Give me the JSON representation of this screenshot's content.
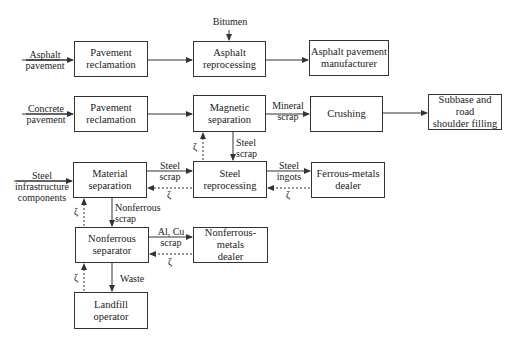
{
  "diagram": {
    "boxes": {
      "pav_rec_1": "Pavement\nreclamation",
      "asphalt_repro": "Asphalt\nreprocessing",
      "asphalt_mfr": "Asphalt pavement\nmanufacturer",
      "pav_rec_2": "Pavement\nreclamation",
      "magnetic_sep": "Magnetic\nseparation",
      "crushing": "Crushing",
      "subbase": "Subbase and road\nshoulder filling",
      "material_sep": "Material\nseparation",
      "steel_repro": "Steel\nreprocessing",
      "ferrous_dealer": "Ferrous-metals\ndealer",
      "nonferrous_sep": "Nonferrous\nseparator",
      "nonferrous_dealer": "Nonferrous-metals\ndealer",
      "landfill": "Landfill\noperator"
    },
    "inputs": {
      "asphalt_pavement": "Asphalt\npavement",
      "bitumen": "Bitumen",
      "concrete_pavement": "Concrete\npavement",
      "steel_infrastructure": "Steel\ninfrastructure\ncomponents"
    },
    "flow_labels": {
      "mineral_scrap": "Mineral\nscrap",
      "steel_scrap_down": "Steel\nscrap",
      "steel_scrap_right": "Steel\nscrap",
      "steel_ingots": "Steel\ningots",
      "nonferrous_scrap": "Nonferrous\nscrap",
      "al_cu_scrap": "Al, Cu\nscrap",
      "waste": "Waste"
    },
    "feedback_symbol": "ζ"
  }
}
